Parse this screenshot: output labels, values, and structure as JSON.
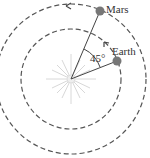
{
  "labels": {
    "mars": "Mars",
    "earth": "Earth",
    "angle": "45°"
  },
  "icons": {
    "sun": "sun-icon",
    "planet_mars": "planet-icon",
    "planet_earth": "planet-icon"
  },
  "colors": {
    "orbit": "#555555",
    "planet": "#777777",
    "sun": "#dddddd",
    "line": "#444444",
    "text": "#333333"
  },
  "angle_degrees": 45
}
